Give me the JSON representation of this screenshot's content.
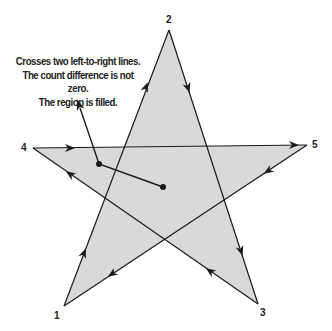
{
  "diagram": {
    "fill_color": "#d9d9d9",
    "stroke_color": "#1a1a1a",
    "vertices": [
      {
        "label": "1",
        "x": 64,
        "y": 306
      },
      {
        "label": "2",
        "x": 169,
        "y": 30
      },
      {
        "label": "3",
        "x": 258,
        "y": 304
      },
      {
        "label": "4",
        "x": 33,
        "y": 148
      },
      {
        "label": "5",
        "x": 307,
        "y": 145
      }
    ],
    "caption": {
      "line1": "Crosses two left-to-right lines.",
      "line2": "The count difference is not zero.",
      "line3": "The region is filled."
    },
    "pointer": {
      "from": {
        "x": 163,
        "y": 187
      },
      "bend": {
        "x": 99,
        "y": 164
      },
      "tip": {
        "x": 79,
        "y": 105
      }
    }
  }
}
